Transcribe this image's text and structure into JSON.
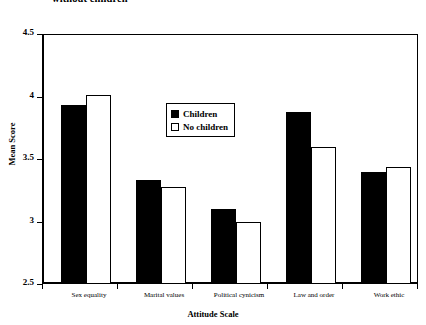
{
  "chart_data": {
    "type": "bar",
    "title": "without children",
    "xlabel": "Attitude Scale",
    "ylabel": "Mean Score",
    "ylim": [
      2.5,
      4.5
    ],
    "yticks": [
      "2.5",
      "3",
      "3.5",
      "4",
      "4.5"
    ],
    "ytick_values": [
      2.5,
      3,
      3.5,
      4,
      4.5
    ],
    "grid": false,
    "legend_position": "inside-upper-center",
    "categories": [
      "Sex equality",
      "Marital values",
      "Political cynicism",
      "Law and order",
      "Work ethic"
    ],
    "series": [
      {
        "name": "Children",
        "fill": "#000000",
        "values": [
          3.93,
          3.33,
          3.1,
          3.88,
          3.4
        ]
      },
      {
        "name": "No children",
        "fill": "#ffffff",
        "values": [
          4.01,
          3.28,
          3.0,
          3.6,
          3.44
        ]
      }
    ]
  },
  "colors": {
    "axis": "#000000",
    "background": "#ffffff",
    "children_fill": "#000000",
    "no_children_fill": "#ffffff"
  }
}
